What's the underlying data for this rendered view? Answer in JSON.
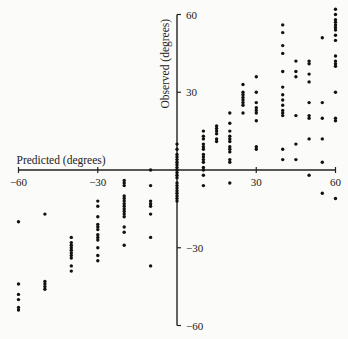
{
  "chart_data": {
    "type": "scatter",
    "title": "",
    "xlabel": "Predicted (degrees)",
    "ylabel": "Observed (degrees)",
    "xlim": [
      -60,
      60
    ],
    "ylim": [
      -60,
      60
    ],
    "grid": false,
    "legend": null,
    "x_ticks": [
      -60,
      -30,
      30,
      60
    ],
    "y_ticks": [
      60,
      30,
      -30,
      -60
    ],
    "x_tick_labels": [
      "−60",
      "−30",
      "30",
      "60"
    ],
    "y_tick_labels": [
      "60",
      "30",
      "−30",
      "−60"
    ],
    "series": [
      {
        "name": "observations",
        "points": [
          [
            -60,
            -20
          ],
          [
            -60,
            -44
          ],
          [
            -60,
            -48
          ],
          [
            -60,
            -50
          ],
          [
            -60,
            -53
          ],
          [
            -60,
            -54
          ],
          [
            -50,
            -17
          ],
          [
            -50,
            -43
          ],
          [
            -50,
            -44
          ],
          [
            -50,
            -45
          ],
          [
            -50,
            -46
          ],
          [
            -40,
            -26
          ],
          [
            -40,
            -28
          ],
          [
            -40,
            -29
          ],
          [
            -40,
            -30
          ],
          [
            -40,
            -31
          ],
          [
            -40,
            -32
          ],
          [
            -40,
            -33
          ],
          [
            -40,
            -34
          ],
          [
            -40,
            -37
          ],
          [
            -40,
            -39
          ],
          [
            -30,
            -12
          ],
          [
            -30,
            -14
          ],
          [
            -30,
            -18
          ],
          [
            -30,
            -21
          ],
          [
            -30,
            -22
          ],
          [
            -30,
            -23
          ],
          [
            -30,
            -25
          ],
          [
            -30,
            -26
          ],
          [
            -30,
            -27
          ],
          [
            -30,
            -30
          ],
          [
            -30,
            -33
          ],
          [
            -30,
            -35
          ],
          [
            -20,
            -4
          ],
          [
            -20,
            -5
          ],
          [
            -20,
            -6
          ],
          [
            -20,
            -10
          ],
          [
            -20,
            -11
          ],
          [
            -20,
            -12
          ],
          [
            -20,
            -13
          ],
          [
            -20,
            -14
          ],
          [
            -20,
            -15
          ],
          [
            -20,
            -16
          ],
          [
            -20,
            -17
          ],
          [
            -20,
            -18
          ],
          [
            -20,
            -22
          ],
          [
            -20,
            -24
          ],
          [
            -20,
            -29
          ],
          [
            -10,
            0
          ],
          [
            -10,
            -6
          ],
          [
            -10,
            -12
          ],
          [
            -10,
            -13
          ],
          [
            -10,
            -14
          ],
          [
            -10,
            -17
          ],
          [
            -10,
            -26
          ],
          [
            -10,
            -37
          ],
          [
            0,
            10
          ],
          [
            0,
            8
          ],
          [
            0,
            6
          ],
          [
            0,
            5
          ],
          [
            0,
            4
          ],
          [
            0,
            3
          ],
          [
            0,
            2
          ],
          [
            0,
            1
          ],
          [
            0,
            0
          ],
          [
            0,
            -1
          ],
          [
            0,
            -2
          ],
          [
            0,
            -3
          ],
          [
            0,
            -5
          ],
          [
            0,
            -6
          ],
          [
            0,
            -7
          ],
          [
            0,
            -8
          ],
          [
            0,
            -9
          ],
          [
            0,
            -10
          ],
          [
            0,
            -11
          ],
          [
            0,
            -12
          ],
          [
            10,
            15
          ],
          [
            10,
            13
          ],
          [
            10,
            12
          ],
          [
            10,
            10
          ],
          [
            10,
            9
          ],
          [
            10,
            8
          ],
          [
            10,
            6
          ],
          [
            10,
            5
          ],
          [
            10,
            4
          ],
          [
            10,
            3
          ],
          [
            10,
            1
          ],
          [
            10,
            0
          ],
          [
            10,
            -2
          ],
          [
            10,
            -6
          ],
          [
            15,
            17
          ],
          [
            15,
            16
          ],
          [
            15,
            15
          ],
          [
            15,
            14
          ],
          [
            15,
            12
          ],
          [
            15,
            11
          ],
          [
            20,
            22
          ],
          [
            20,
            18
          ],
          [
            20,
            15
          ],
          [
            20,
            13
          ],
          [
            20,
            12
          ],
          [
            20,
            11
          ],
          [
            20,
            9
          ],
          [
            20,
            8
          ],
          [
            20,
            7
          ],
          [
            20,
            4
          ],
          [
            20,
            3
          ],
          [
            20,
            -5
          ],
          [
            25,
            33
          ],
          [
            25,
            30
          ],
          [
            25,
            29
          ],
          [
            25,
            28
          ],
          [
            25,
            27
          ],
          [
            25,
            26
          ],
          [
            25,
            25
          ],
          [
            25,
            22
          ],
          [
            30,
            36
          ],
          [
            30,
            30
          ],
          [
            30,
            26
          ],
          [
            30,
            24
          ],
          [
            30,
            23
          ],
          [
            30,
            22
          ],
          [
            30,
            19
          ],
          [
            30,
            9
          ],
          [
            30,
            8
          ],
          [
            40,
            56
          ],
          [
            40,
            53
          ],
          [
            40,
            48
          ],
          [
            40,
            45
          ],
          [
            40,
            38
          ],
          [
            40,
            32
          ],
          [
            40,
            29
          ],
          [
            40,
            27
          ],
          [
            40,
            25
          ],
          [
            40,
            23
          ],
          [
            40,
            22
          ],
          [
            40,
            21
          ],
          [
            40,
            8
          ],
          [
            40,
            4
          ],
          [
            45,
            42
          ],
          [
            45,
            38
          ],
          [
            45,
            36
          ],
          [
            45,
            21
          ],
          [
            45,
            10
          ],
          [
            45,
            4
          ],
          [
            50,
            42
          ],
          [
            50,
            41
          ],
          [
            50,
            37
          ],
          [
            50,
            34
          ],
          [
            50,
            26
          ],
          [
            50,
            21
          ],
          [
            50,
            20
          ],
          [
            50,
            12
          ],
          [
            50,
            -2
          ],
          [
            55,
            51
          ],
          [
            55,
            26
          ],
          [
            55,
            20
          ],
          [
            55,
            12
          ],
          [
            55,
            3
          ],
          [
            55,
            -9
          ],
          [
            60,
            62
          ],
          [
            60,
            60
          ],
          [
            60,
            58
          ],
          [
            60,
            57
          ],
          [
            60,
            56
          ],
          [
            60,
            55
          ],
          [
            60,
            54
          ],
          [
            60,
            52
          ],
          [
            60,
            50
          ],
          [
            60,
            44
          ],
          [
            60,
            42
          ],
          [
            60,
            41
          ],
          [
            60,
            40
          ],
          [
            60,
            30
          ],
          [
            60,
            20
          ],
          [
            60,
            19
          ],
          [
            60,
            -11
          ]
        ]
      }
    ]
  }
}
